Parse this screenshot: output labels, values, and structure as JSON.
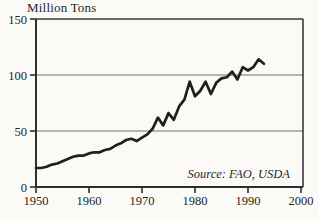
{
  "page": {
    "background": "#fbfaf7"
  },
  "chart_data": {
    "type": "line",
    "title": "Million Tons",
    "source_note": "Source: FAO, USDA",
    "series_name": "world-production-million-tons",
    "x": [
      1950,
      1951,
      1952,
      1953,
      1954,
      1955,
      1956,
      1957,
      1958,
      1959,
      1960,
      1961,
      1962,
      1963,
      1964,
      1965,
      1966,
      1967,
      1968,
      1969,
      1970,
      1971,
      1972,
      1973,
      1974,
      1975,
      1976,
      1977,
      1978,
      1979,
      1980,
      1981,
      1982,
      1983,
      1984,
      1985,
      1986,
      1987,
      1988,
      1989,
      1990,
      1991,
      1992,
      1993
    ],
    "values": [
      17,
      17,
      18,
      20,
      21,
      23,
      25,
      27,
      28,
      28,
      30,
      31,
      31,
      33,
      34,
      37,
      39,
      42,
      43,
      41,
      44,
      47,
      52,
      62,
      55,
      66,
      60,
      72,
      78,
      94,
      81,
      86,
      94,
      83,
      93,
      97,
      98,
      103,
      96,
      107,
      104,
      107,
      114,
      110
    ],
    "xlabel": "",
    "ylabel": "Million Tons",
    "xlim": [
      1950,
      2000
    ],
    "ylim": [
      0,
      150
    ],
    "x_ticks": [
      1950,
      1960,
      1970,
      1980,
      1990,
      2000
    ],
    "y_ticks": [
      0,
      50,
      100,
      150
    ],
    "gridlines_y": [
      50,
      100
    ],
    "grid_on": true,
    "legend_position": "none",
    "colors": {
      "line": "#1f1f1f",
      "grid": "#6e6e6e",
      "axis": "#2f2f2f",
      "border": "#3a3a3a",
      "text": "#242424"
    }
  }
}
